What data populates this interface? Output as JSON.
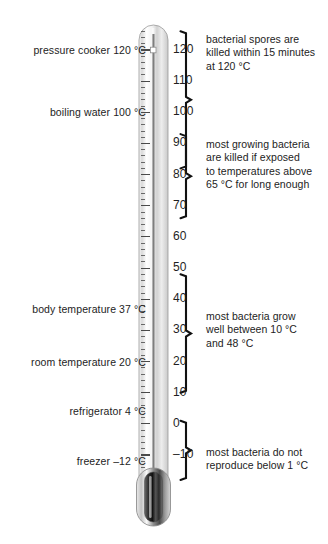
{
  "figure": {
    "background": "#ffffff",
    "ink": "#232323"
  },
  "thermometer": {
    "name": "laboratory-thermometer",
    "unit": "°C",
    "scale_min": -14,
    "scale_max": 126,
    "major_step": 10,
    "minor_step": 2,
    "liquid_level": 120,
    "marker_value": 120
  },
  "scale_labels": [
    {
      "value": 120,
      "text": "120"
    },
    {
      "value": 110,
      "text": "110"
    },
    {
      "value": 100,
      "text": "100"
    },
    {
      "value": 90,
      "text": "90"
    },
    {
      "value": 80,
      "text": "80"
    },
    {
      "value": 70,
      "text": "70"
    },
    {
      "value": 60,
      "text": "60"
    },
    {
      "value": 50,
      "text": "50"
    },
    {
      "value": 40,
      "text": "40"
    },
    {
      "value": 30,
      "text": "30"
    },
    {
      "value": 20,
      "text": "20"
    },
    {
      "value": 10,
      "text": "10"
    },
    {
      "value": 0,
      "text": "0"
    },
    {
      "value": -10,
      "text": "–10"
    }
  ],
  "reference_points": [
    {
      "label": "pressure cooker 120 °C",
      "value": 120
    },
    {
      "label": "boiling water 100 °C",
      "value": 100
    },
    {
      "label": "body temperature 37 °C",
      "value": 37
    },
    {
      "label": "room temperature 20 °C",
      "value": 20
    },
    {
      "label": "refrigerator 4 °C",
      "value": 4
    },
    {
      "label": "freezer –12 °C",
      "value": -12
    }
  ],
  "annotations": [
    {
      "id": "spores",
      "lines": [
        "bacterial spores are",
        "killed within 15 minutes",
        "at 120 °C"
      ],
      "range_top": 126,
      "range_bottom": 82
    },
    {
      "id": "growing-bacteria-killed",
      "lines": [
        "most growing bacteria",
        "are killed if exposed",
        "to temperatures above",
        "65 °C for long enough"
      ],
      "range_top": 93,
      "range_bottom": 66
    },
    {
      "id": "bacteria-grow",
      "lines": [
        "most bacteria grow",
        "well between 10 °C",
        "and 48 °C"
      ],
      "range_top": 48,
      "range_bottom": 10
    },
    {
      "id": "no-reproduce",
      "lines": [
        "most bacteria do not",
        "reproduce below 1 °C"
      ],
      "range_top": 1,
      "range_bottom": -18
    }
  ],
  "chart_data": {
    "type": "scale",
    "ylabel": "Temperature (°C)",
    "ylim": [
      -14,
      126
    ],
    "tick_values": [
      120,
      110,
      100,
      90,
      80,
      70,
      60,
      50,
      40,
      30,
      20,
      10,
      0,
      -10
    ],
    "markers": [
      {
        "name": "pressure cooker",
        "value": 120
      },
      {
        "name": "boiling water",
        "value": 100
      },
      {
        "name": "body temperature",
        "value": 37
      },
      {
        "name": "room temperature",
        "value": 20
      },
      {
        "name": "refrigerator",
        "value": 4
      },
      {
        "name": "freezer",
        "value": -12
      }
    ],
    "bands": [
      {
        "name": "bacterial spores killed within 15 minutes at 120 °C",
        "from": 82,
        "to": 126
      },
      {
        "name": "most growing bacteria killed above 65 °C",
        "from": 66,
        "to": 93
      },
      {
        "name": "most bacteria grow well between 10 °C and 48 °C",
        "from": 10,
        "to": 48
      },
      {
        "name": "most bacteria do not reproduce below 1 °C",
        "from": -18,
        "to": 1
      }
    ]
  }
}
